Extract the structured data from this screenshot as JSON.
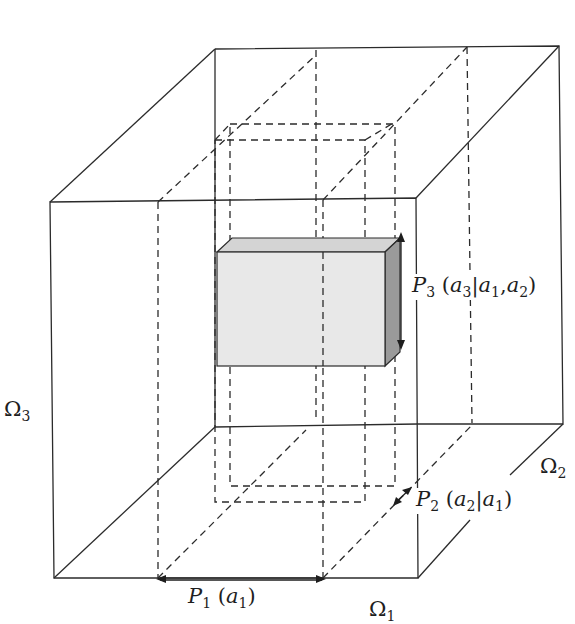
{
  "figure": {
    "type": "3d-product-space-diagram",
    "colors": {
      "line": "#2b2b2b",
      "box_front": "#e8e8e8",
      "box_top": "#d4d4d4",
      "box_side": "#9a9a9a"
    },
    "axes": {
      "omega1": {
        "symbol": "Ω",
        "sub": "1"
      },
      "omega2": {
        "symbol": "Ω",
        "sub": "2"
      },
      "omega3": {
        "symbol": "Ω",
        "sub": "3"
      }
    },
    "labels": {
      "p1": {
        "name": "P",
        "sub": "1",
        "args_open": "(",
        "var": "a",
        "var_sub": "1",
        "args_close": ")"
      },
      "p2": {
        "name": "P",
        "sub": "2",
        "args_open": "(",
        "var": "a",
        "var_sub": "2",
        "bar": "|",
        "cond": "a",
        "cond_sub": "1",
        "args_close": ")"
      },
      "p3": {
        "name": "P",
        "sub": "3",
        "args_open": "(",
        "var": "a",
        "var_sub": "3",
        "bar": "|",
        "cond1": "a",
        "cond1_sub": "1",
        "comma": ",",
        "cond2": "a",
        "cond2_sub": "2",
        "args_close": ")"
      }
    }
  }
}
